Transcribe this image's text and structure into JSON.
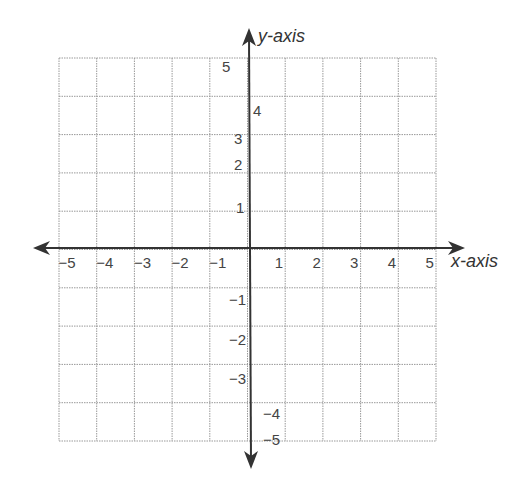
{
  "diagram": {
    "type": "coordinate-plane",
    "x_axis_label": "x-axis",
    "y_axis_label": "y-axis",
    "x_range": [
      -5,
      5
    ],
    "y_range": [
      -5,
      5
    ],
    "grid_step": 1,
    "x_tick_labels": [
      "−5",
      "−4",
      "−3",
      "−2",
      "−1",
      "1",
      "2",
      "3",
      "4",
      "5"
    ],
    "y_tick_labels": [
      "5",
      "4",
      "3",
      "2",
      "1",
      "−1",
      "−2",
      "−3",
      "−4",
      "−5"
    ],
    "colors": {
      "axis": "#333333",
      "grid": "#999999",
      "label": "#444444"
    }
  },
  "chart_data": {
    "type": "coordinate-grid",
    "title": "",
    "xlabel": "x-axis",
    "ylabel": "y-axis",
    "xlim": [
      -5,
      5
    ],
    "ylim": [
      -5,
      5
    ],
    "grid": true,
    "x_ticks": [
      -5,
      -4,
      -3,
      -2,
      -1,
      1,
      2,
      3,
      4,
      5
    ],
    "y_ticks": [
      5,
      4,
      3,
      2,
      1,
      -1,
      -2,
      -3,
      -4,
      -5
    ],
    "series": []
  }
}
